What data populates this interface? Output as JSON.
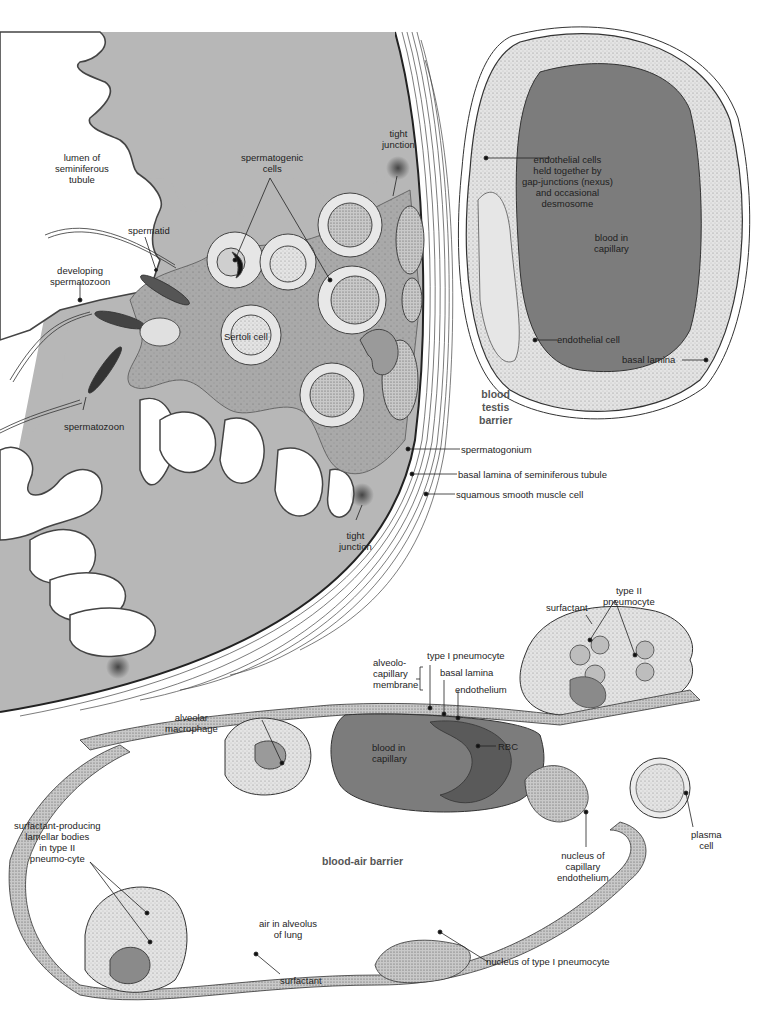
{
  "figure": {
    "panels": [
      {
        "id": "blood-testis",
        "title": "blood\ntestis\nbarrier"
      },
      {
        "id": "blood-air",
        "title": "blood-air barrier"
      }
    ],
    "colors": {
      "epithelium_gray": "#b7b7b7",
      "blood_dark_gray": "#7c7c7c",
      "stipple_light": "#dcdcdc",
      "outline": "#3a3a3a",
      "background": "#ffffff"
    }
  },
  "testis_labels": {
    "lumen": "lumen of\nseminiferous\ntubule",
    "tight_junction_top": "tight\njunction",
    "spermatogenic_cells": "spermatogenic\ncells",
    "spermatid": "spermatid",
    "developing_spermatozoon": "developing\nspermatozoon",
    "sertoli_cell": "Sertoli cell",
    "spermatozoon": "spermatozoon",
    "endothelial_cells_junction": "endothelial cells\nheld together by\ngap-junctions (nexus)\nand occasional\ndesmosome",
    "blood_in_capillary": "blood in\ncapillary",
    "endothelial_cell": "endothelial cell",
    "basal_lamina": "basal lamina",
    "spermatogonium": "spermatogonium",
    "basal_lamina_tubule": "basal lamina of seminiferous tubule",
    "squamous_smooth_muscle": "squamous smooth muscle cell",
    "tight_junction_bottom": "tight\njunction"
  },
  "lung_labels": {
    "surfactant_top": "surfactant",
    "type2_pneumocyte": "type II\npneumocyte",
    "alveolo_capillary_membrane": "alveolo-\ncapillary\nmembrane",
    "type1_pneumocyte": "type I pneumocyte",
    "basal_lamina": "basal lamina",
    "endothelium": "endothelium",
    "alveolar_macrophage": "alveolar\nmacrophage",
    "blood_in_capillary": "blood in\ncapillary",
    "rbc": "RBC",
    "plasma_cell": "plasma\ncell",
    "surfactant_producing": "surfactant-producing\nlamellar bodies\nin type II\npneumo-cyte",
    "nucleus_capillary_endothelium": "nucleus of\ncapillary\nendothelium",
    "air_in_alveolus": "air in alveolus\nof lung",
    "nucleus_type1": "nucleus of type I pneumocyte",
    "surfactant_bottom": "surfactant"
  }
}
